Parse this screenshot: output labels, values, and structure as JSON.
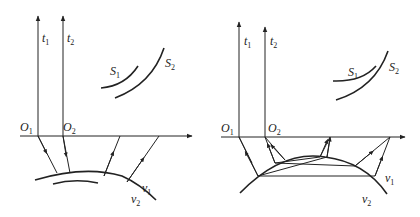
{
  "figure": {
    "panels": [
      {
        "id": "left",
        "labels": {
          "t1": "t",
          "t1_sub": "1",
          "t2": "t",
          "t2_sub": "2",
          "S1": "S",
          "S1_sub": "1",
          "S2": "S",
          "S2_sub": "2",
          "O1": "O",
          "O1_sub": "1",
          "O2": "O",
          "O2_sub": "2",
          "v1": "v",
          "v1_sub": "1",
          "v2": "v",
          "v2_sub": "2"
        },
        "description": "Two-layer model: direct reflected rays from convex interface"
      },
      {
        "id": "right",
        "labels": {
          "t1": "t",
          "t1_sub": "1",
          "t2": "t",
          "t2_sub": "2",
          "S1": "S",
          "S1_sub": "1",
          "S2": "S",
          "S2_sub": "2",
          "O1": "O",
          "O1_sub": "1",
          "O2": "O",
          "O2_sub": "2",
          "v1": "v",
          "v1_sub": "1",
          "v2": "v",
          "v2_sub": "2"
        },
        "description": "Convex interface with multiple reflected/refracted ray paths"
      }
    ]
  }
}
